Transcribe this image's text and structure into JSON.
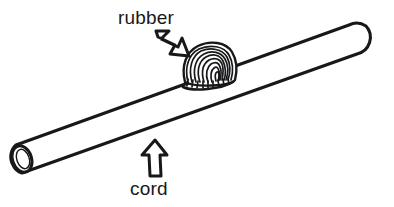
{
  "figure": {
    "background_color": "#ffffff",
    "ink_color": "#17181a",
    "width": 394,
    "height": 207,
    "style": "black-and-white line drawing"
  },
  "labels": [
    {
      "id": "rubber",
      "text": "rubber",
      "x": 118,
      "y": 24,
      "arrow": {
        "name": "arrow-down-right",
        "direction": "down-right",
        "from_x": 156,
        "from_y": 30,
        "to_x": 189,
        "to_y": 56
      }
    },
    {
      "id": "cord",
      "text": "cord",
      "x": 130,
      "y": 195,
      "arrow": {
        "name": "arrow-up",
        "direction": "up",
        "from_x": 155,
        "from_y": 176,
        "to_x": 155,
        "to_y": 140
      }
    }
  ],
  "objects": {
    "cord": {
      "name": "cord",
      "shape": "cylinder",
      "open_end": "left",
      "rounded_end": "right",
      "left_end_x": 20,
      "left_end_y": 160,
      "right_end_x": 372,
      "right_end_y": 41
    },
    "rubber": {
      "name": "rubber",
      "shape": "wound coil bundle",
      "center_x": 209,
      "center_y": 64,
      "wrap_count": 9
    }
  }
}
